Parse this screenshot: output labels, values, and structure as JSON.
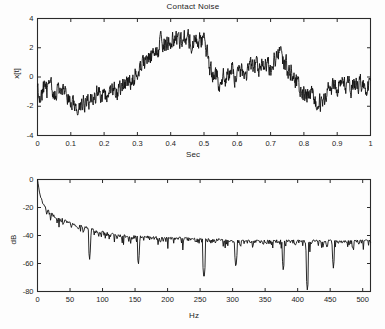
{
  "figure": {
    "width": 385,
    "height": 329,
    "background": "#fdfdfd",
    "trace_color": "#111111",
    "axis_color": "#2a2a2a"
  },
  "chart_data": [
    {
      "type": "line",
      "id": "time-series",
      "title": "Contact Noise",
      "xlabel": "Sec",
      "ylabel": "x[t]",
      "xlim": [
        0,
        1
      ],
      "ylim": [
        -4,
        4
      ],
      "xticks": [
        0,
        0.1,
        0.2,
        0.3,
        0.4,
        0.5,
        0.6,
        0.7,
        0.8,
        0.9,
        1
      ],
      "xticklabels": [
        "0",
        "0.1",
        "0.2",
        "0.3",
        "0.4",
        "0.5",
        "0.6",
        "0.7",
        "0.8",
        "0.9",
        "1"
      ],
      "yticks": [
        -4,
        -2,
        0,
        2,
        4
      ],
      "yticklabels": [
        "-4",
        "-2",
        "0",
        "2",
        "4"
      ],
      "grid": false,
      "legend": null,
      "series": [
        {
          "name": "x[t]",
          "description": "Broadband random contact-noise waveform, 1 second record, amplitude roughly -2.7 to +3.3, with a slow wandering low-frequency trend: near -1 at t=0, minimum about -2.6 near t=0.12, rising through zero near t=0.30, broad maximum about +3.2 between t=0.37 and t=0.50, abrupt drop at t=0.50 to about -0.6, secondary hump about +2.1 near t=0.73, dip about -2.2 near t=0.84, ending near -0.6 at t=1.",
          "x_start": 0,
          "x_end": 1,
          "n_points": 1024,
          "trend_anchors_x": [
            0.0,
            0.03,
            0.06,
            0.09,
            0.12,
            0.15,
            0.18,
            0.21,
            0.24,
            0.27,
            0.3,
            0.33,
            0.36,
            0.39,
            0.42,
            0.45,
            0.48,
            0.5,
            0.52,
            0.55,
            0.58,
            0.61,
            0.64,
            0.67,
            0.7,
            0.73,
            0.76,
            0.79,
            0.82,
            0.85,
            0.88,
            0.91,
            0.94,
            0.97,
            1.0
          ],
          "trend_anchors_y": [
            -1.05,
            -0.85,
            -0.95,
            -1.3,
            -2.1,
            -1.55,
            -1.05,
            -1.25,
            -0.95,
            -0.45,
            0.55,
            1.15,
            1.55,
            2.45,
            2.35,
            2.55,
            2.45,
            2.6,
            0.35,
            -0.35,
            0.25,
            0.05,
            0.55,
            0.75,
            0.85,
            1.55,
            0.35,
            -0.85,
            -1.35,
            -1.85,
            -0.85,
            -0.35,
            -0.65,
            -0.45,
            -0.7
          ],
          "noise_amplitude": 0.55,
          "notable_points": [
            {
              "x": 0.12,
              "y": -2.62,
              "label": "minimum"
            },
            {
              "x": 0.37,
              "y": 3.25,
              "label": "peak"
            },
            {
              "x": 0.5,
              "y": 3.1,
              "label": "peak before drop"
            },
            {
              "x": 0.73,
              "y": 2.1,
              "label": "secondary hump"
            },
            {
              "x": 0.84,
              "y": -2.25,
              "label": "late dip"
            }
          ]
        }
      ]
    },
    {
      "type": "line",
      "id": "spectrum",
      "title": "",
      "xlabel": "Hz",
      "ylabel": "dB",
      "xlim": [
        0,
        512
      ],
      "ylim": [
        -80,
        0
      ],
      "xticks": [
        0,
        50,
        100,
        150,
        200,
        250,
        300,
        350,
        400,
        450,
        500
      ],
      "xticklabels": [
        "0",
        "50",
        "100",
        "150",
        "200",
        "250",
        "300",
        "350",
        "400",
        "450",
        "500"
      ],
      "yticks": [
        -80,
        -60,
        -40,
        -20,
        0
      ],
      "yticklabels": [
        "-80",
        "-60",
        "-40",
        "-20",
        "0"
      ],
      "grid": false,
      "legend": null,
      "series": [
        {
          "name": "Power spectrum (dB)",
          "description": "Power spectral density of the contact noise. Starts at 0 dB at DC, falls very steeply over the first 10 Hz to about -22 dB, continues a 1/f-like rolloff to about -38 dB by 80 Hz, then flattens into a noise floor near -45 dB from roughly 120 Hz to 512 Hz with dense scatter of about +/-8 dB. Several deep narrow nulls reach -58 to -80 dB.",
          "x_start": 0,
          "x_end": 512,
          "n_points": 512,
          "envelope_x": [
            0,
            3,
            6,
            10,
            15,
            20,
            28,
            36,
            45,
            55,
            65,
            80,
            95,
            110,
            130,
            150,
            175,
            200,
            225,
            250,
            275,
            300,
            330,
            360,
            390,
            420,
            450,
            480,
            512
          ],
          "envelope_y": [
            0,
            -9,
            -15,
            -21,
            -24,
            -26,
            -29,
            -30,
            -32,
            -34,
            -35,
            -37,
            -39,
            -41,
            -42,
            -43,
            -43,
            -44,
            -44,
            -45,
            -45,
            -46,
            -46,
            -46,
            -46,
            -46,
            -46,
            -46,
            -46
          ],
          "noise_amplitude": 6.5,
          "notable_points": [
            {
              "x": 0,
              "y": 0,
              "label": "DC peak"
            },
            {
              "x": 80,
              "y": -58,
              "label": "null"
            },
            {
              "x": 155,
              "y": -62,
              "label": "null"
            },
            {
              "x": 256,
              "y": -72,
              "label": "deep null"
            },
            {
              "x": 305,
              "y": -64,
              "label": "null"
            },
            {
              "x": 378,
              "y": -66,
              "label": "null"
            },
            {
              "x": 415,
              "y": -80,
              "label": "deepest null"
            },
            {
              "x": 455,
              "y": -64,
              "label": "null"
            }
          ]
        }
      ]
    }
  ]
}
